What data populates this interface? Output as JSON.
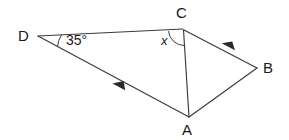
{
  "figure": {
    "background_color": "#ffffff",
    "stroke_color": "#3a3a3a",
    "text_color": "#1a1a1a"
  },
  "vertices": [
    {
      "id": "D",
      "label": "D",
      "x": 38,
      "y": 36
    },
    {
      "id": "C",
      "label": "C",
      "x": 183,
      "y": 29
    },
    {
      "id": "B",
      "label": "B",
      "x": 257,
      "y": 68
    },
    {
      "id": "A",
      "label": "A",
      "x": 189,
      "y": 117
    }
  ],
  "segments": [
    {
      "id": "DC",
      "from": "D",
      "to": "C",
      "x1": 38,
      "y1": 36,
      "x2": 183,
      "y2": 29
    },
    {
      "id": "DA",
      "from": "D",
      "to": "A",
      "x1": 38,
      "y1": 36,
      "x2": 189,
      "y2": 117
    },
    {
      "id": "CA",
      "from": "C",
      "to": "A",
      "x1": 183,
      "y1": 30,
      "x2": 189,
      "y2": 117
    },
    {
      "id": "CB",
      "from": "C",
      "to": "B",
      "x1": 184,
      "y1": 30,
      "x2": 257,
      "y2": 68
    },
    {
      "id": "AB",
      "from": "A",
      "to": "B",
      "x1": 189,
      "y1": 117,
      "x2": 257,
      "y2": 68
    }
  ],
  "arrow_markers": [
    {
      "id": "arrow-DA",
      "on_segment": "DA",
      "x": 119,
      "y": 87,
      "direction": "toward-D",
      "meaning": "parallel-mark"
    },
    {
      "id": "arrow-CB",
      "on_segment": "CB",
      "x": 228,
      "y": 47,
      "direction": "toward-C",
      "meaning": "parallel-mark"
    }
  ],
  "angles": [
    {
      "id": "angle-D",
      "at_vertex": "D",
      "label": "35°",
      "value": 35,
      "unit": "degrees",
      "marker": "arc"
    },
    {
      "id": "angle-C",
      "at_vertex": "C",
      "label": "x",
      "value": null,
      "unit": "unknown",
      "marker": "arc"
    }
  ]
}
